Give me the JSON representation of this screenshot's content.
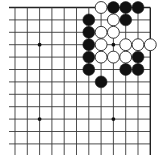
{
  "board": {
    "cols": 12,
    "rows": 12,
    "origin_x": 15,
    "origin_y": 7.5,
    "spacing_x": 12.3,
    "spacing_y": 12.4,
    "top_edge": true,
    "right_edge": true,
    "line_color": "#3a3a3a",
    "edge_color": "#222222"
  },
  "star_points": [
    {
      "col": 2,
      "row": 3
    },
    {
      "col": 8,
      "row": 3
    },
    {
      "col": 2,
      "row": 9
    },
    {
      "col": 8,
      "row": 9
    }
  ],
  "stones": [
    {
      "color": "white",
      "col": 7,
      "row": 0
    },
    {
      "color": "black",
      "col": 8,
      "row": 0
    },
    {
      "color": "black",
      "col": 9,
      "row": 0
    },
    {
      "color": "black",
      "col": 10,
      "row": 0
    },
    {
      "color": "black",
      "col": 6,
      "row": 1
    },
    {
      "color": "white",
      "col": 8,
      "row": 1
    },
    {
      "color": "black",
      "col": 9,
      "row": 1
    },
    {
      "color": "black",
      "col": 6,
      "row": 2
    },
    {
      "color": "white",
      "col": 7,
      "row": 2
    },
    {
      "color": "white",
      "col": 8,
      "row": 2
    },
    {
      "color": "black",
      "col": 6,
      "row": 3
    },
    {
      "color": "white",
      "col": 7,
      "row": 3
    },
    {
      "color": "white",
      "col": 9,
      "row": 3
    },
    {
      "color": "white",
      "col": 10,
      "row": 3
    },
    {
      "color": "white",
      "col": 11,
      "row": 3
    },
    {
      "color": "black",
      "col": 6,
      "row": 4
    },
    {
      "color": "white",
      "col": 7,
      "row": 4
    },
    {
      "color": "white",
      "col": 8,
      "row": 4
    },
    {
      "color": "white",
      "col": 9,
      "row": 4
    },
    {
      "color": "black",
      "col": 10,
      "row": 4
    },
    {
      "color": "black",
      "col": 6,
      "row": 5
    },
    {
      "color": "black",
      "col": 9,
      "row": 5
    },
    {
      "color": "black",
      "col": 10,
      "row": 5
    },
    {
      "color": "black",
      "col": 7,
      "row": 6
    }
  ],
  "colors": {
    "black_stone": "#111111",
    "white_stone": "#ffffff",
    "stone_outline": "#222222",
    "background": "#ffffff"
  }
}
